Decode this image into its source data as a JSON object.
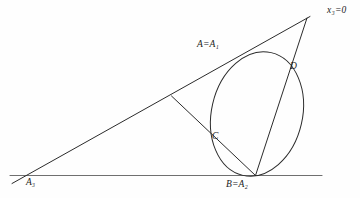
{
  "figure": {
    "type": "geometric-diagram",
    "background_color": "#fefefe",
    "stroke_color": "#2b2b2b",
    "baseline_color": "#6a6a6a"
  },
  "labels": {
    "vertex_a": {
      "main": "A",
      "equals": "=",
      "second": "A",
      "second_sub": "1",
      "text": "A=A₁"
    },
    "vertex_b": {
      "main": "B",
      "equals": "=",
      "second": "A",
      "second_sub": "2",
      "text": "B=A₂"
    },
    "vertex_a3": {
      "main": "A",
      "sub": "3",
      "text": "A₃"
    },
    "point_c": {
      "main": "C",
      "text": "C"
    },
    "point_d": {
      "main": "D",
      "text": "D"
    },
    "line_x3": {
      "main": "x",
      "sub": "3",
      "equals": "=0",
      "text": "x₃=0"
    }
  },
  "geometry": {
    "baseline": {
      "x1": 10,
      "y1": 175.5,
      "x2": 322,
      "y2": 175.5
    },
    "diagonal_line": {
      "x1": 12,
      "y1": 183,
      "x2": 309,
      "y2": 17
    },
    "apex": {
      "x": 307,
      "y": 18
    },
    "cevian_apex_to_b": {
      "x1": 307,
      "y1": 18,
      "x2": 255,
      "y2": 175
    },
    "cevian_inner": {
      "x1": 172,
      "y1": 96,
      "x2": 255,
      "y2": 175
    },
    "ellipse": {
      "cx": 257,
      "cy": 114,
      "rx": 45,
      "ry": 63,
      "rotation_deg": 13
    },
    "tangent_points": {
      "A": {
        "x": 248,
        "y": 52
      },
      "B": {
        "x": 255,
        "y": 175
      },
      "C": {
        "x": 218,
        "y": 146
      },
      "D": {
        "x": 288,
        "y": 70
      }
    }
  }
}
